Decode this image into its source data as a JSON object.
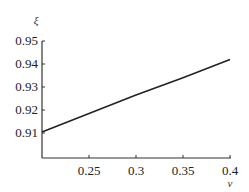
{
  "chart_data": {
    "type": "line",
    "title": "",
    "xlabel": "ν",
    "ylabel": "ξ",
    "xlim": [
      0.2,
      0.4
    ],
    "ylim": [
      0.9,
      0.95
    ],
    "x_ticks": [
      0.25,
      0.3,
      0.35,
      0.4
    ],
    "x_tick_labels": [
      "0.25",
      "0.3",
      "0.35",
      "0.4"
    ],
    "y_ticks": [
      0.91,
      0.92,
      0.93,
      0.94,
      0.95
    ],
    "y_tick_labels": [
      "0.91",
      "0.92",
      "0.93",
      "0.94",
      "0.95"
    ],
    "grid": false,
    "legend": null,
    "series": [
      {
        "name": "ξ(ν)",
        "color": "#222222",
        "x": [
          0.2,
          0.25,
          0.3,
          0.35,
          0.4
        ],
        "y": [
          0.9105,
          0.9185,
          0.9265,
          0.934,
          0.942
        ]
      }
    ]
  }
}
